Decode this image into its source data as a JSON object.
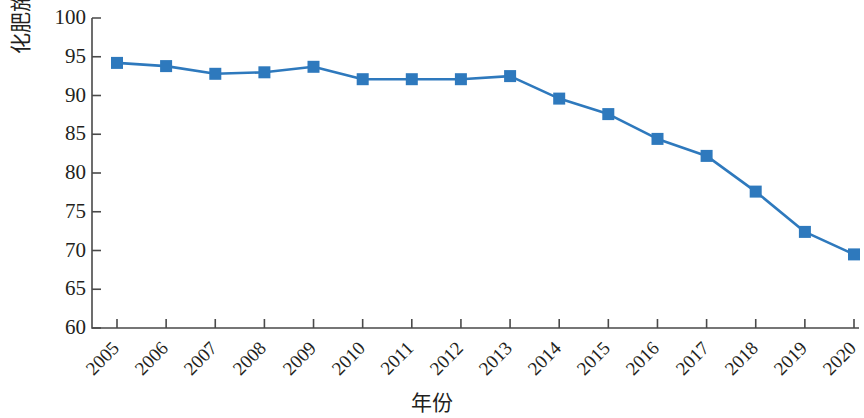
{
  "chart_data": {
    "type": "line",
    "title": "",
    "xlabel": "年份",
    "ylabel": "化肥施用量/万吨",
    "categories": [
      "2005",
      "2006",
      "2007",
      "2008",
      "2009",
      "2010",
      "2011",
      "2012",
      "2013",
      "2014",
      "2015",
      "2016",
      "2017",
      "2018",
      "2019",
      "2020"
    ],
    "values": [
      94.2,
      93.8,
      92.8,
      93.0,
      93.7,
      92.1,
      92.1,
      92.1,
      92.5,
      89.6,
      87.6,
      84.4,
      82.2,
      77.6,
      72.4,
      69.5
    ],
    "series": [
      {
        "name": "化肥施用量",
        "values": [
          94.2,
          93.8,
          92.8,
          93.0,
          93.7,
          92.1,
          92.1,
          92.1,
          92.5,
          89.6,
          87.6,
          84.4,
          82.2,
          77.6,
          72.4,
          69.5
        ]
      }
    ],
    "ylim": [
      60,
      100
    ],
    "y_ticks": [
      60,
      65,
      70,
      75,
      80,
      85,
      90,
      95,
      100
    ],
    "y_tick_labels": [
      "60",
      "65",
      "70",
      "75",
      "80",
      "85",
      "90",
      "95",
      "100"
    ],
    "grid": false,
    "legend": "none",
    "marker": "square",
    "series_color": "#2E79BD",
    "axis_color": "#3f3f3f",
    "x_tick_rotation": "-45"
  },
  "axis": {
    "ylabel": "化肥施用量/万吨",
    "xlabel": "年份"
  }
}
